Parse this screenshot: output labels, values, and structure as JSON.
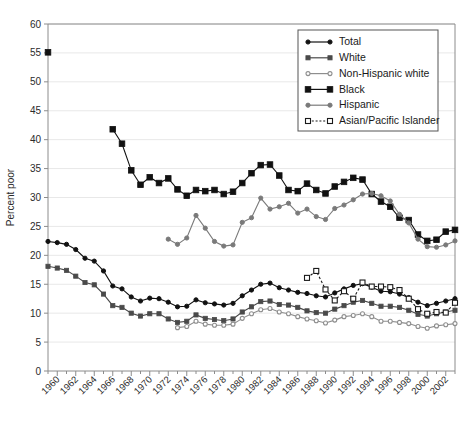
{
  "chart_data": {
    "type": "line",
    "title": "",
    "xlabel": "",
    "ylabel": "Percent poor",
    "ylim": [
      0,
      60
    ],
    "ytick_step": 5,
    "yticks": [
      0,
      5,
      10,
      15,
      20,
      25,
      30,
      35,
      40,
      45,
      50,
      55,
      60
    ],
    "ytick_labels": [
      "0",
      "5",
      "10",
      "15",
      "20",
      "25",
      "30",
      "35",
      "40",
      "45",
      "50",
      "55",
      "60"
    ],
    "xlim": [
      1959,
      2003
    ],
    "xticks": [
      1960,
      1962,
      1964,
      1966,
      1968,
      1970,
      1972,
      1974,
      1976,
      1978,
      1980,
      1982,
      1984,
      1986,
      1988,
      1990,
      1992,
      1994,
      1996,
      1998,
      2000,
      2002
    ],
    "xtick_labels": [
      "1960",
      "1962",
      "1964",
      "1966",
      "1968",
      "1970",
      "1972",
      "1974",
      "1976",
      "1978",
      "1980",
      "1982",
      "1984",
      "1986",
      "1988",
      "1990",
      "1992",
      "1994",
      "1996",
      "1998",
      "2000",
      "2002"
    ],
    "grid": true,
    "grid_axis": "y",
    "legend_position": "top-right",
    "series": [
      {
        "name": "Total",
        "marker": "filled-circle",
        "marker_size": 4.2,
        "color": "#111111",
        "line_style": "solid",
        "x": [
          1959,
          1960,
          1961,
          1962,
          1963,
          1964,
          1965,
          1966,
          1967,
          1968,
          1969,
          1970,
          1971,
          1972,
          1973,
          1974,
          1975,
          1976,
          1977,
          1978,
          1979,
          1980,
          1981,
          1982,
          1983,
          1984,
          1985,
          1986,
          1987,
          1988,
          1989,
          1990,
          1991,
          1992,
          1993,
          1994,
          1995,
          1996,
          1997,
          1998,
          1999,
          2000,
          2001,
          2002,
          2003
        ],
        "y": [
          22.4,
          22.2,
          21.9,
          21.0,
          19.5,
          19.0,
          17.3,
          14.7,
          14.2,
          12.8,
          12.1,
          12.6,
          12.5,
          11.9,
          11.1,
          11.2,
          12.3,
          11.8,
          11.6,
          11.4,
          11.7,
          13.0,
          14.0,
          15.0,
          15.2,
          14.4,
          14.0,
          13.6,
          13.4,
          13.0,
          12.8,
          13.5,
          14.2,
          14.8,
          15.1,
          14.5,
          13.8,
          13.7,
          13.3,
          12.7,
          11.9,
          11.3,
          11.7,
          12.1,
          12.5
        ]
      },
      {
        "name": "White",
        "marker": "filled-square",
        "marker_size": 4.2,
        "color": "#4a4a4a",
        "line_style": "solid",
        "x": [
          1959,
          1960,
          1961,
          1962,
          1963,
          1964,
          1965,
          1966,
          1967,
          1968,
          1969,
          1970,
          1971,
          1972,
          1973,
          1974,
          1975,
          1976,
          1977,
          1978,
          1979,
          1980,
          1981,
          1982,
          1983,
          1984,
          1985,
          1986,
          1987,
          1988,
          1989,
          1990,
          1991,
          1992,
          1993,
          1994,
          1995,
          1996,
          1997,
          1998,
          1999,
          2000,
          2001,
          2002,
          2003
        ],
        "y": [
          18.1,
          17.8,
          17.4,
          16.4,
          15.3,
          14.9,
          13.3,
          11.3,
          11.0,
          10.0,
          9.5,
          9.9,
          9.9,
          9.0,
          8.4,
          8.6,
          9.7,
          9.1,
          8.9,
          8.7,
          9.0,
          10.2,
          11.1,
          12.0,
          12.1,
          11.5,
          11.4,
          11.0,
          10.4,
          10.1,
          10.0,
          10.7,
          11.3,
          11.9,
          12.2,
          11.7,
          11.2,
          11.2,
          11.0,
          10.5,
          9.8,
          9.5,
          9.9,
          10.2,
          10.5
        ]
      },
      {
        "name": "Non-Hispanic white",
        "marker": "open-circle",
        "marker_size": 4.0,
        "color": "#8e8e8e",
        "line_style": "solid",
        "x": [
          1973,
          1974,
          1975,
          1976,
          1977,
          1978,
          1979,
          1980,
          1981,
          1982,
          1983,
          1984,
          1985,
          1986,
          1987,
          1988,
          1989,
          1990,
          1991,
          1992,
          1993,
          1994,
          1995,
          1996,
          1997,
          1998,
          1999,
          2000,
          2001,
          2002,
          2003
        ],
        "y": [
          7.5,
          7.7,
          8.6,
          8.1,
          7.9,
          7.9,
          8.1,
          9.1,
          9.9,
          10.6,
          10.8,
          10.2,
          9.9,
          9.4,
          9.0,
          8.7,
          8.3,
          8.8,
          9.4,
          9.6,
          9.9,
          9.4,
          8.6,
          8.6,
          8.4,
          8.2,
          7.7,
          7.4,
          7.8,
          8.0,
          8.2
        ]
      },
      {
        "name": "Black",
        "marker": "filled-square",
        "marker_size": 5.6,
        "color": "#111111",
        "line_style": "solid",
        "x": [
          1959,
          1966,
          1967,
          1968,
          1969,
          1970,
          1971,
          1972,
          1973,
          1974,
          1975,
          1976,
          1977,
          1978,
          1979,
          1980,
          1981,
          1982,
          1983,
          1984,
          1985,
          1986,
          1987,
          1988,
          1989,
          1990,
          1991,
          1992,
          1993,
          1994,
          1995,
          1996,
          1997,
          1998,
          1999,
          2000,
          2001,
          2002,
          2003
        ],
        "y": [
          55.1,
          41.8,
          39.3,
          34.7,
          32.2,
          33.5,
          32.5,
          33.3,
          31.4,
          30.3,
          31.3,
          31.1,
          31.3,
          30.6,
          31.0,
          32.5,
          34.2,
          35.6,
          35.7,
          33.8,
          31.3,
          31.1,
          32.4,
          31.3,
          30.7,
          31.9,
          32.7,
          33.4,
          33.1,
          30.6,
          29.3,
          28.4,
          26.5,
          26.1,
          23.6,
          22.5,
          22.7,
          24.1,
          24.4
        ]
      },
      {
        "name": "Hispanic",
        "marker": "filled-circle",
        "marker_size": 4.2,
        "color": "#7a7a7a",
        "line_style": "solid",
        "x": [
          1972,
          1973,
          1974,
          1975,
          1976,
          1977,
          1978,
          1979,
          1980,
          1981,
          1982,
          1983,
          1984,
          1985,
          1986,
          1987,
          1988,
          1989,
          1990,
          1991,
          1992,
          1993,
          1994,
          1995,
          1996,
          1997,
          1998,
          1999,
          2000,
          2001,
          2002,
          2003
        ],
        "y": [
          22.8,
          21.9,
          23.0,
          26.9,
          24.7,
          22.4,
          21.6,
          21.8,
          25.7,
          26.5,
          29.9,
          28.0,
          28.4,
          29.0,
          27.3,
          28.0,
          26.7,
          26.2,
          28.1,
          28.7,
          29.6,
          30.6,
          30.7,
          30.3,
          29.4,
          27.1,
          25.6,
          22.8,
          21.5,
          21.4,
          21.8,
          22.5
        ]
      },
      {
        "name": "Asian/Pacific Islander",
        "marker": "open-square",
        "marker_size": 5.0,
        "color": "#1a1a1a",
        "line_style": "dashed",
        "x": [
          1987,
          1988,
          1989,
          1990,
          1991,
          1992,
          1993,
          1994,
          1995,
          1996,
          1997,
          1998,
          1999,
          2000,
          2001,
          2002,
          2003
        ],
        "y": [
          16.1,
          17.3,
          14.1,
          12.2,
          13.8,
          12.5,
          15.3,
          14.6,
          14.6,
          14.5,
          14.0,
          12.5,
          10.7,
          9.9,
          10.2,
          10.1,
          11.8
        ]
      }
    ]
  },
  "axis": {
    "y_title": "Percent poor"
  },
  "legend": {
    "items": [
      {
        "label": "Total"
      },
      {
        "label": "White"
      },
      {
        "label": "Non-Hispanic white"
      },
      {
        "label": "Black"
      },
      {
        "label": "Hispanic"
      },
      {
        "label": "Asian/Pacific Islander"
      }
    ]
  }
}
